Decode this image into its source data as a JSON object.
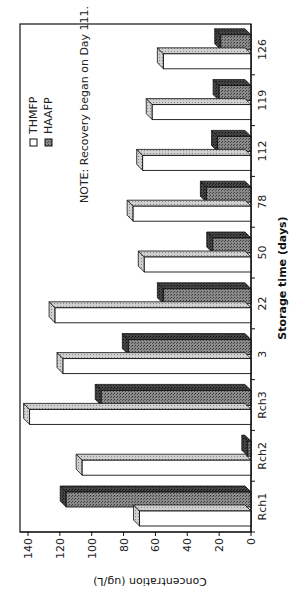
{
  "chart_data": {
    "type": "bar",
    "orientation": "rotated 90 degrees counterclockwise (3D clustered column chart)",
    "title": "",
    "xlabel": "Storage time (days)",
    "ylabel": "Concentration (ug/L)",
    "ylim": [
      0,
      140
    ],
    "yticks": [
      0,
      20,
      40,
      60,
      80,
      100,
      120,
      140
    ],
    "categories": [
      "Rch1",
      "Rch2",
      "Rch3",
      "3",
      "22",
      "50",
      "78",
      "112",
      "119",
      "126"
    ],
    "series": [
      {
        "name": "THMFP",
        "values": [
          70,
          106,
          139,
          118,
          123,
          67,
          74,
          68,
          62,
          55
        ],
        "fill": "white"
      },
      {
        "name": "HAAFP",
        "values": [
          116,
          2,
          94,
          77,
          55,
          24,
          28,
          21,
          20,
          19
        ],
        "fill": "dark-hatched"
      }
    ],
    "legend": {
      "position": "upper-left inside plot",
      "entries": [
        "THMFP",
        "HAAFP"
      ]
    },
    "annotations": [
      "NOTE:  Recovery began on Day 111."
    ],
    "grid": false
  },
  "axes": {
    "x_title": "Storage time (days)",
    "y_title": "Concentration (ug/L)"
  },
  "legend": {
    "thmfp": "THMFP",
    "haafp": "HAAFP"
  },
  "note": "NOTE:  Recovery began on Day 111.",
  "colors": {
    "thmfp_front": "#ffffff",
    "thmfp_top": "#bdbdbd",
    "haafp_front": "#7a7a7a",
    "haafp_top": "#3a3a3a",
    "outline": "#111111"
  }
}
